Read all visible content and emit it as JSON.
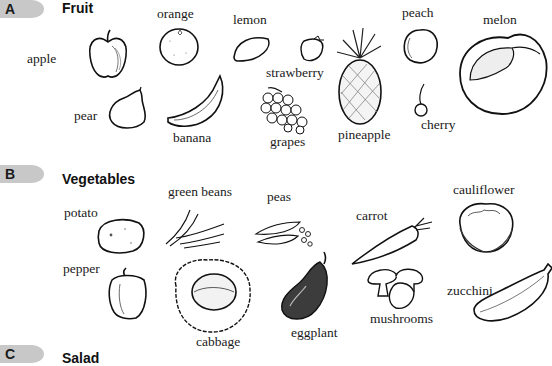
{
  "sections": [
    {
      "letter": "A",
      "title": "Fruit",
      "items": [
        "orange",
        "lemon",
        "peach",
        "melon",
        "apple",
        "strawberry",
        "pear",
        "banana",
        "grapes",
        "pineapple",
        "cherry"
      ]
    },
    {
      "letter": "B",
      "title": "Vegetables",
      "items": [
        "green beans",
        "peas",
        "cauliflower",
        "potato",
        "carrot",
        "pepper",
        "zucchini",
        "mushrooms",
        "eggplant",
        "cabbage"
      ]
    },
    {
      "letter": "C",
      "title": "Salad",
      "items": []
    }
  ],
  "colors": {
    "badge": "#c8c8c8",
    "ink": "#1a1a1a",
    "background": "#ffffff"
  }
}
